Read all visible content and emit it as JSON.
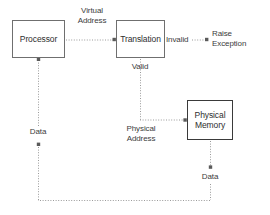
{
  "diagram": {
    "background_color": "#ffffff",
    "line_color": "#9a9a9a",
    "text_color": "#2e2e2e",
    "nodes": [
      {
        "id": "processor",
        "label": "Processor",
        "border_color": "#6f6f6f",
        "fill": "#ffffff"
      },
      {
        "id": "translation",
        "label": "Translation",
        "border_color": "#6f6f6f",
        "fill": "#ffffff"
      },
      {
        "id": "physical_memory",
        "label": "Physical\nMemory",
        "border_color": "#3a3a3a",
        "fill": "#ffffff"
      }
    ],
    "edges": [
      {
        "id": "processor_to_translation",
        "from": "processor",
        "to": "translation",
        "label": "Virtual\nAddress",
        "style": "dotted",
        "arrow": true
      },
      {
        "id": "translation_invalid",
        "from": "translation",
        "to": "raise_exception",
        "label": "Invalid",
        "style": "dotted",
        "arrow": true
      },
      {
        "id": "translation_valid",
        "from": "translation",
        "to": "physical_memory",
        "label": "Valid",
        "label2": "Physical\nAddress",
        "style": "dotted",
        "arrow": true
      },
      {
        "id": "memory_to_processor",
        "from": "physical_memory",
        "to": "processor",
        "label": "Data",
        "label2": "Data",
        "style": "dotted",
        "arrow": true
      }
    ],
    "terminals": [
      {
        "id": "raise_exception",
        "label": "Raise\nException"
      }
    ],
    "labels": {
      "virtual_address": "Virtual\nAddress",
      "invalid": "Invalid",
      "raise_exception": "Raise\nException",
      "valid": "Valid",
      "physical_address": "Physical\nAddress",
      "data_left": "Data",
      "data_right": "Data"
    }
  }
}
